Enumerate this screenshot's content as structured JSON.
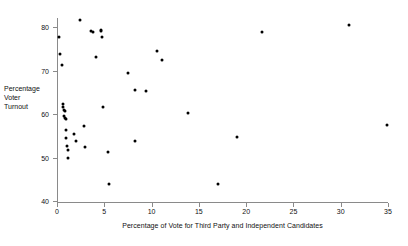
{
  "chart_data": {
    "type": "scatter",
    "title": "",
    "xlabel": "Percentage of Vote for Third Party and Independent Candidates",
    "ylabel": "Percentage Voter Turnout",
    "ylabel_lines": [
      "Percentage",
      "Voter",
      "Turnout"
    ],
    "xlim": [
      0,
      35
    ],
    "ylim": [
      40,
      82
    ],
    "xticks": [
      0,
      5,
      10,
      15,
      20,
      25,
      30,
      35
    ],
    "xtick_labels": [
      "0",
      "5",
      "10",
      "15",
      "20",
      "25",
      "30",
      "35"
    ],
    "yticks": [
      40,
      50,
      60,
      70,
      80
    ],
    "ytick_labels": [
      "40",
      "50",
      "60",
      "70",
      "80"
    ],
    "grid": false,
    "legend": "none",
    "marker": "filled-circle",
    "marker_color": "#000000",
    "axis_color": "#8a8a8a",
    "points": [
      {
        "x": 0.2,
        "y": 77.8
      },
      {
        "x": 0.3,
        "y": 73.8
      },
      {
        "x": 0.5,
        "y": 71.2
      },
      {
        "x": 0.6,
        "y": 62.2
      },
      {
        "x": 0.6,
        "y": 61.5
      },
      {
        "x": 0.7,
        "y": 61.0
      },
      {
        "x": 0.8,
        "y": 60.6
      },
      {
        "x": 0.7,
        "y": 59.5
      },
      {
        "x": 0.8,
        "y": 59.0
      },
      {
        "x": 0.9,
        "y": 58.9
      },
      {
        "x": 0.9,
        "y": 56.4
      },
      {
        "x": 1.0,
        "y": 54.5
      },
      {
        "x": 1.1,
        "y": 52.6
      },
      {
        "x": 1.2,
        "y": 51.8
      },
      {
        "x": 1.2,
        "y": 50.0
      },
      {
        "x": 1.8,
        "y": 55.3
      },
      {
        "x": 2.0,
        "y": 53.8
      },
      {
        "x": 2.4,
        "y": 81.5
      },
      {
        "x": 2.9,
        "y": 57.2
      },
      {
        "x": 3.0,
        "y": 52.3
      },
      {
        "x": 3.6,
        "y": 79.0
      },
      {
        "x": 3.8,
        "y": 78.8
      },
      {
        "x": 4.1,
        "y": 73.1
      },
      {
        "x": 4.6,
        "y": 79.2
      },
      {
        "x": 4.7,
        "y": 79.0
      },
      {
        "x": 4.8,
        "y": 77.6
      },
      {
        "x": 4.9,
        "y": 61.5
      },
      {
        "x": 5.4,
        "y": 51.3
      },
      {
        "x": 5.5,
        "y": 43.8
      },
      {
        "x": 7.5,
        "y": 69.5
      },
      {
        "x": 8.2,
        "y": 65.5
      },
      {
        "x": 8.3,
        "y": 53.8
      },
      {
        "x": 9.4,
        "y": 65.3
      },
      {
        "x": 10.6,
        "y": 74.5
      },
      {
        "x": 11.1,
        "y": 72.5
      },
      {
        "x": 13.9,
        "y": 60.3
      },
      {
        "x": 17.0,
        "y": 43.8
      },
      {
        "x": 19.0,
        "y": 54.8
      },
      {
        "x": 21.7,
        "y": 78.8
      },
      {
        "x": 30.9,
        "y": 80.5
      },
      {
        "x": 34.9,
        "y": 57.5
      }
    ]
  }
}
